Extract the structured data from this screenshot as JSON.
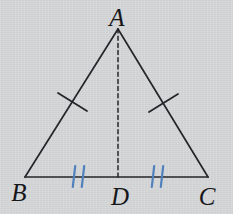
{
  "diagram": {
    "type": "geometry",
    "canvas": {
      "width": 233,
      "height": 214,
      "background": "#d4d6d8"
    },
    "colors": {
      "line": "#26262a",
      "side_tick": "#26262a",
      "base_tick": "#4f80bc",
      "label": "#17171a"
    },
    "labels": {
      "A": "A",
      "B": "B",
      "C": "C",
      "D": "D"
    },
    "points": {
      "A": {
        "x": 118,
        "y": 29
      },
      "B": {
        "x": 25,
        "y": 177
      },
      "C": {
        "x": 208,
        "y": 177
      },
      "D": {
        "x": 118,
        "y": 177
      }
    },
    "edges": [
      {
        "name": "side-ab",
        "from": "A",
        "to": "B",
        "style": "solid",
        "width": 1.7
      },
      {
        "name": "side-ac",
        "from": "A",
        "to": "C",
        "style": "solid",
        "width": 1.7
      },
      {
        "name": "side-bc",
        "from": "B",
        "to": "C",
        "style": "solid",
        "width": 1.7
      },
      {
        "name": "median-ad",
        "from": "A",
        "to": "D",
        "style": "dashed",
        "width": 1.5,
        "dash": "4 3.2"
      }
    ],
    "tick_marks": [
      {
        "name": "tick-ab",
        "segment": "AB",
        "x1": 58,
        "y1": 93,
        "x2": 87,
        "y2": 111,
        "color_key": "side_tick",
        "width": 1.8
      },
      {
        "name": "tick-ac",
        "segment": "AC",
        "x1": 149,
        "y1": 112,
        "x2": 178,
        "y2": 94,
        "color_key": "side_tick",
        "width": 1.8
      },
      {
        "name": "tick-bd-1",
        "segment": "BD",
        "x1": 75.2,
        "y1": 166,
        "x2": 72.8,
        "y2": 187,
        "color_key": "base_tick",
        "width": 2.2
      },
      {
        "name": "tick-bd-2",
        "segment": "BD",
        "x1": 84.2,
        "y1": 166,
        "x2": 81.8,
        "y2": 187,
        "color_key": "base_tick",
        "width": 2.2
      },
      {
        "name": "tick-dc-1",
        "segment": "DC",
        "x1": 154.2,
        "y1": 166,
        "x2": 151.8,
        "y2": 187,
        "color_key": "base_tick",
        "width": 2.2
      },
      {
        "name": "tick-dc-2",
        "segment": "DC",
        "x1": 163.2,
        "y1": 166,
        "x2": 160.8,
        "y2": 187,
        "color_key": "base_tick",
        "width": 2.2
      }
    ],
    "relations": [
      "AB = AC",
      "BD = DC"
    ]
  }
}
